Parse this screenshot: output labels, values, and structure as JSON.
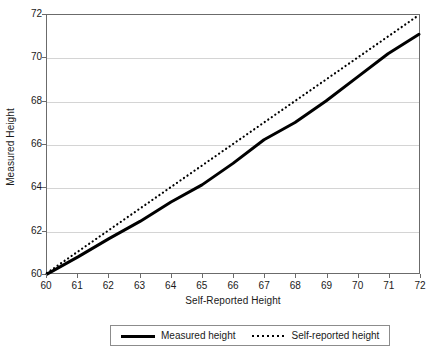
{
  "chart_data": {
    "type": "line",
    "title": "",
    "xlabel": "Self-Reported Height",
    "ylabel": "Measured Height",
    "xlim": [
      60,
      72
    ],
    "ylim": [
      60,
      72
    ],
    "xticks": [
      60,
      61,
      62,
      63,
      64,
      65,
      66,
      67,
      68,
      69,
      70,
      71,
      72
    ],
    "yticks": [
      60,
      62,
      64,
      66,
      68,
      70,
      72
    ],
    "xticklabels": [
      "60",
      "61",
      "62",
      "63",
      "64",
      "65",
      "66",
      "67",
      "68",
      "69",
      "70",
      "71",
      "72"
    ],
    "yticklabels": [
      "60",
      "62",
      "64",
      "66",
      "68",
      "70",
      "72"
    ],
    "grid": "horizontal",
    "legend_position": "bottom",
    "x": [
      60,
      61,
      62,
      63,
      64,
      65,
      66,
      67,
      68,
      69,
      70,
      71,
      72
    ],
    "series": [
      {
        "name": "Measured height",
        "style": "solid",
        "color": "#000000",
        "values": [
          59.95,
          60.75,
          61.6,
          62.4,
          63.3,
          64.1,
          65.1,
          66.2,
          67.0,
          68.0,
          69.1,
          70.2,
          71.1
        ]
      },
      {
        "name": "Self-reported height",
        "style": "dotted",
        "color": "#000000",
        "values": [
          60,
          61,
          62,
          63,
          64,
          65,
          66,
          67,
          68,
          69,
          70,
          71,
          72
        ]
      }
    ]
  },
  "legend": {
    "entries": [
      {
        "label": "Measured height",
        "marker": "solid-line-icon"
      },
      {
        "label": "Self-reported height",
        "marker": "dotted-line-icon"
      }
    ]
  }
}
